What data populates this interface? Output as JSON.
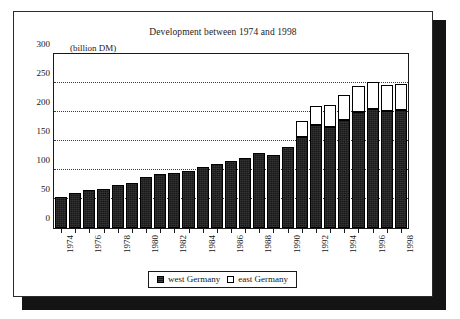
{
  "chart_data": {
    "type": "bar",
    "title": "Development between 1974 and 1998",
    "subtitle": "",
    "unit_label": "(billion DM)",
    "xlabel": "",
    "ylabel": "",
    "ylim": [
      0,
      300
    ],
    "ytick_values": [
      0,
      50,
      100,
      150,
      200,
      250,
      300
    ],
    "ytick_labels": [
      "0",
      "50",
      "100",
      "150",
      "200",
      "250",
      "300"
    ],
    "grid": "horizontal-dotted",
    "stacked": true,
    "legend_position": "bottom-center",
    "categories": [
      "1974",
      "1975",
      "1976",
      "1977",
      "1978",
      "1979",
      "1980",
      "1981",
      "1982",
      "1983",
      "1984",
      "1985",
      "1986",
      "1987",
      "1988",
      "1989",
      "1990",
      "1991",
      "1992",
      "1993",
      "1994",
      "1995",
      "1996",
      "1997",
      "1998"
    ],
    "xtick_labels_shown": [
      "1974",
      "",
      "1976",
      "",
      "1978",
      "",
      "1980",
      "",
      "1982",
      "",
      "1984",
      "",
      "1986",
      "",
      "1988",
      "",
      "1990",
      "",
      "1992",
      "",
      "1994",
      "",
      "1996",
      "",
      "1998"
    ],
    "series": [
      {
        "name": "west Germany",
        "color": "#181818",
        "values": [
          53,
          60,
          66,
          68,
          74,
          78,
          88,
          93,
          95,
          99,
          105,
          110,
          116,
          120,
          130,
          126,
          139,
          157,
          177,
          174,
          187,
          200,
          206,
          202,
          204
        ]
      },
      {
        "name": "east Germany",
        "color": "#ffffff",
        "values": [
          0,
          0,
          0,
          0,
          0,
          0,
          0,
          0,
          0,
          0,
          0,
          0,
          0,
          0,
          0,
          0,
          0,
          27,
          34,
          38,
          43,
          44,
          45,
          45,
          45
        ]
      }
    ]
  },
  "legend": {
    "entries": [
      {
        "label": "west Germany",
        "swatch": "filled-dark-square-icon"
      },
      {
        "label": "east Germany",
        "swatch": "hollow-white-square-icon"
      }
    ]
  }
}
